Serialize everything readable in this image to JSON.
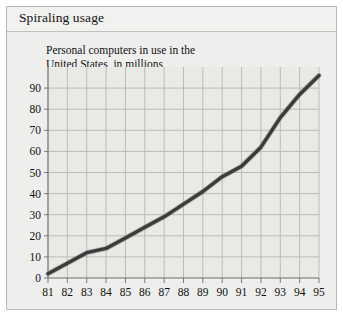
{
  "panel": {
    "title": "Spiraling usage",
    "background_color": "#eeeeec",
    "border_color": "#b8b8b4"
  },
  "chart_data": {
    "type": "line",
    "title": "Spiraling usage",
    "subtitle": "Personal computers in use in the\nUnited States, in millions",
    "xlabel": "",
    "ylabel": "",
    "categories": [
      "81",
      "82",
      "83",
      "84",
      "85",
      "86",
      "87",
      "88",
      "89",
      "90",
      "91",
      "92",
      "93",
      "94",
      "95"
    ],
    "x": [
      81,
      82,
      83,
      84,
      85,
      86,
      87,
      88,
      89,
      90,
      91,
      92,
      93,
      94,
      95
    ],
    "values": [
      2,
      7,
      12,
      14,
      19,
      24,
      29,
      35,
      41,
      48,
      53,
      62,
      76,
      87,
      96
    ],
    "ylim": [
      0,
      100
    ],
    "yticks": [
      0,
      10,
      20,
      30,
      40,
      50,
      60,
      70,
      80,
      90
    ],
    "ytick_labels": [
      "0",
      "10",
      "20",
      "30",
      "40",
      "50",
      "60",
      "70",
      "80",
      "90"
    ],
    "grid": true,
    "legend": false,
    "series": [
      {
        "name": "Personal computers in use in the United States, in millions",
        "color": "#3b3b3b",
        "values": [
          2,
          7,
          12,
          14,
          19,
          24,
          29,
          35,
          41,
          48,
          53,
          62,
          76,
          87,
          96
        ]
      }
    ],
    "grid_color": "#b6b6b2",
    "plot_background": "#e9e9e6"
  }
}
